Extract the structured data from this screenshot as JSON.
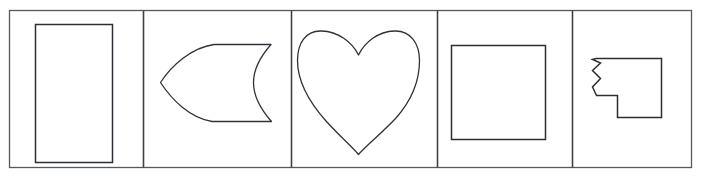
{
  "figure": {
    "width": 702,
    "height": 177,
    "background_color": "#ffffff",
    "frame_color": "#555a5e",
    "divider_color": "#3d4246",
    "shape_outline_color": "#2b2f33",
    "shape_fill_color": "#ffffff",
    "panel_count": 5,
    "clipped_caption": ""
  },
  "frame": {
    "label": "outer-border",
    "x": 9,
    "y": 10,
    "width": 683,
    "height": 158
  },
  "dividers": {
    "label": "panel-dividers",
    "x_positions": [
      143,
      291,
      437,
      572
    ]
  },
  "panels": [
    {
      "index": 1,
      "name": "rectangle-panel",
      "shape": "rectangle",
      "shape_label": "Rectangle",
      "bounds": {
        "x": 9,
        "y": 10,
        "width": 134,
        "height": 158
      },
      "shape_bounds": {
        "x": 35,
        "y": 24,
        "width": 78,
        "height": 139
      }
    },
    {
      "index": 2,
      "name": "leaf-panel",
      "shape": "leaf",
      "shape_label": "Leaf / pointed crescent",
      "bounds": {
        "x": 143,
        "y": 10,
        "width": 148,
        "height": 158
      },
      "shape_bounds": {
        "x": 160,
        "y": 43,
        "width": 112,
        "height": 79
      }
    },
    {
      "index": 3,
      "name": "heart-panel",
      "shape": "heart",
      "shape_label": "Heart",
      "bounds": {
        "x": 291,
        "y": 10,
        "width": 146,
        "height": 158
      },
      "shape_bounds": {
        "x": 297,
        "y": 30,
        "width": 123,
        "height": 125
      }
    },
    {
      "index": 4,
      "name": "square-panel",
      "shape": "square",
      "shape_label": "Square",
      "bounds": {
        "x": 437,
        "y": 10,
        "width": 135,
        "height": 158
      },
      "shape_bounds": {
        "x": 451,
        "y": 45,
        "width": 95,
        "height": 95
      }
    },
    {
      "index": 5,
      "name": "torn-square-panel",
      "shape": "torn-notched-square",
      "shape_label": "Square with zigzag torn edge and corner notch",
      "bounds": {
        "x": 572,
        "y": 10,
        "width": 120,
        "height": 158
      },
      "shape_bounds": {
        "x": 592,
        "y": 58,
        "width": 70,
        "height": 60
      },
      "zigzag_teeth": 4
    }
  ]
}
